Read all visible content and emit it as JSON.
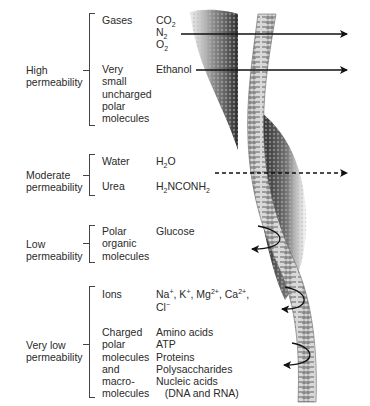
{
  "groups": [
    {
      "label": "High\npermeability",
      "items": [
        {
          "class": "Gases",
          "examples_html": "CO<sub>2</sub><br>N<sub>2</sub><br>O<sub>2</sub>"
        },
        {
          "class": "Very\nsmall\nuncharged\npolar\nmolecules",
          "examples": "Ethanol"
        }
      ]
    },
    {
      "label": "Moderate\npermeability",
      "items": [
        {
          "class": "Water",
          "examples_html": "H<sub>2</sub>O"
        },
        {
          "class": "Urea",
          "examples_html": "H<sub>2</sub>NCONH<sub>2</sub>"
        }
      ]
    },
    {
      "label": "Low\npermeability",
      "items": [
        {
          "class": "Polar\norganic\nmolecules",
          "examples": "Glucose"
        }
      ]
    },
    {
      "label": "Very low\npermeability",
      "items": [
        {
          "class": "Ions",
          "examples_html": "Na<sup>+</sup>, K<sup>+</sup>, Mg<sup>2+</sup>, Ca<sup>2+</sup>,<br>Cl<sup>−</sup>"
        },
        {
          "class": "Charged\npolar\nmolecules\nand\nmacro-\nmolecules",
          "examples": "Amino acids\nATP\nProteins\nPolysaccharides\nNucleic acids\n   (DNA and RNA)"
        }
      ]
    }
  ],
  "arrows": {
    "gases": "passes-through",
    "ethanol": "passes-through",
    "urea": "passes-through-dashed",
    "glucose": "bounces-back",
    "ions": "bounces-back",
    "charged": "bounces-back"
  },
  "colors": {
    "text": "#2a2a2a",
    "line": "#222222",
    "membrane_dark": "#1a1a1a",
    "membrane_light": "#c8c8c8"
  }
}
